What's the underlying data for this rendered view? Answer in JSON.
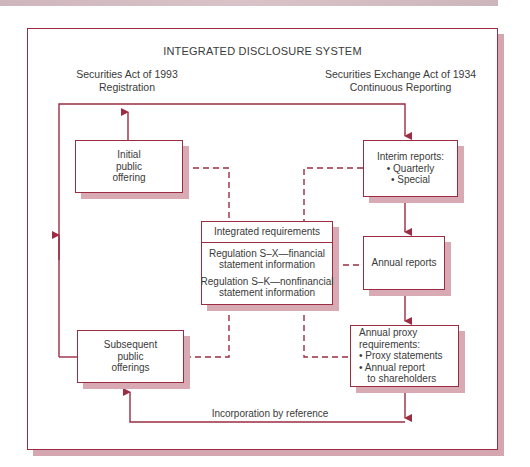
{
  "title": "INTEGRATED DISCLOSURE SYSTEM",
  "left_header": {
    "line1": "Securities Act of 1993",
    "line2": "Registration"
  },
  "right_header": {
    "line1": "Securities Exchange Act of 1934",
    "line2": "Continuous Reporting"
  },
  "boxes": {
    "initial_offering": {
      "lines": [
        "Initial",
        "public",
        "offering"
      ]
    },
    "interim_reports": {
      "lines": [
        "Interim reports:",
        "• Quarterly",
        "• Special"
      ]
    },
    "integrated": {
      "header": "Integrated requirements",
      "sx": [
        "Regulation S–X—financial",
        "statement information"
      ],
      "sk": [
        "Regulation S–K—nonfinancial",
        "statement information"
      ]
    },
    "annual_reports": {
      "lines": [
        "Annual reports"
      ]
    },
    "annual_proxy": {
      "lines": [
        "Annual proxy",
        "requirements:",
        "• Proxy statements",
        "• Annual report",
        "   to shareholders"
      ]
    },
    "subsequent_offerings": {
      "lines": [
        "Subsequent",
        "public",
        "offerings"
      ]
    }
  },
  "bottom_label": "Incorporation by reference",
  "colors": {
    "line": "#9b2c42",
    "shadow": "#d8aab4",
    "text": "#3a3a3a"
  }
}
